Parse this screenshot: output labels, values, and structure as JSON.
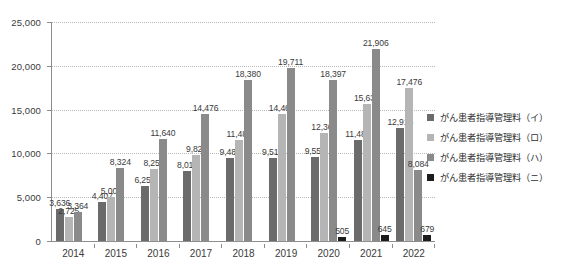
{
  "chart_data": {
    "type": "bar",
    "title": "",
    "subtitle": "",
    "xlabel": "",
    "ylabel": "",
    "ylim": [
      0,
      25000
    ],
    "ytick_step": 5000,
    "ytick_labels": [
      "0",
      "5,000",
      "10,000",
      "15,000",
      "20,000",
      "25,000"
    ],
    "ytick_values": [
      0,
      5000,
      10000,
      15000,
      20000,
      25000
    ],
    "grid": true,
    "grid_style": "dotted-horizontal",
    "legend_position": "right",
    "categories": [
      "2014",
      "2015",
      "2016",
      "2017",
      "2018",
      "2019",
      "2020",
      "2021",
      "2022"
    ],
    "series": [
      {
        "name": "がん患者指導管理料（イ）",
        "color": "#6b6b6b",
        "values": [
          3636,
          4407,
          6250,
          8010,
          9480,
          9516,
          9559,
          11483,
          12916
        ],
        "labels": [
          "3,636",
          "4,407",
          "6,250",
          "8,010",
          "9,480",
          "9,516",
          "9,559",
          "11,483",
          "12,916"
        ]
      },
      {
        "name": "がん患者指導管理料（ロ）",
        "color": "#b5b5b5",
        "values": [
          2725,
          5007,
          8259,
          9824,
          11482,
          14461,
          12366,
          15630,
          17476
        ],
        "labels": [
          "2,725",
          "5,007",
          "8,259",
          "9,824",
          "11,482",
          "14,461",
          "12,366",
          "15,630",
          "17,476"
        ]
      },
      {
        "name": "がん患者指導管理料（ハ）",
        "color": "#8a8a8a",
        "values": [
          3364,
          8324,
          11640,
          14476,
          18380,
          19711,
          18397,
          21906,
          8084
        ],
        "labels": [
          "3,364",
          "8,324",
          "11,640",
          "14,476",
          "18,380",
          "19,711",
          "18,397",
          "21,906",
          "8,084"
        ]
      },
      {
        "name": "がん患者指導管理料（ニ）",
        "color": "#1c1c1c",
        "values": [
          null,
          null,
          null,
          null,
          null,
          null,
          505,
          645,
          679
        ],
        "labels": [
          "",
          "",
          "",
          "",
          "",
          "",
          "505",
          "645",
          "679"
        ]
      }
    ]
  },
  "legend": {
    "items": [
      {
        "label": "がん患者指導管理料（イ）",
        "color": "#6b6b6b"
      },
      {
        "label": "がん患者指導管理料（ロ）",
        "color": "#b5b5b5"
      },
      {
        "label": "がん患者指導管理料（ハ）",
        "color": "#8a8a8a"
      },
      {
        "label": "がん患者指導管理料（ニ）",
        "color": "#1c1c1c"
      }
    ]
  }
}
